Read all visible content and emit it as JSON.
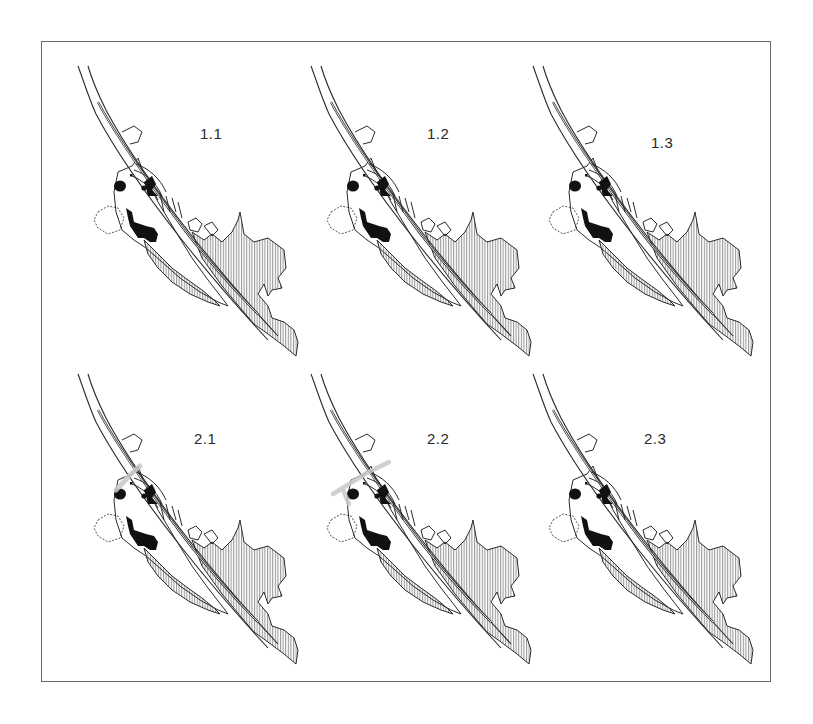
{
  "figure": {
    "colors": {
      "frame": "#6a6a6a",
      "line": "#2a2a2a",
      "hatch": "#555555",
      "solid_fill": "#111111",
      "overlay_gray": "#c8c8c8",
      "background": "#ffffff"
    },
    "panels": [
      {
        "id": "1.1",
        "label": "1.1",
        "row": 1,
        "col": 1,
        "overlay": false
      },
      {
        "id": "1.2",
        "label": "1.2",
        "row": 1,
        "col": 2,
        "overlay": false
      },
      {
        "id": "1.3",
        "label": "1.3",
        "row": 1,
        "col": 3,
        "overlay": false
      },
      {
        "id": "2.1",
        "label": "2.1",
        "row": 2,
        "col": 1,
        "overlay": true
      },
      {
        "id": "2.2",
        "label": "2.2",
        "row": 2,
        "col": 2,
        "overlay": true
      },
      {
        "id": "2.3",
        "label": "2.3",
        "row": 2,
        "col": 3,
        "overlay": false
      }
    ]
  }
}
